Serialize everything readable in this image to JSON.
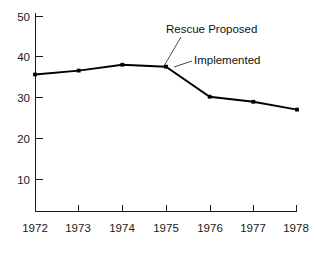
{
  "chart_data": {
    "type": "line",
    "title": "",
    "xlabel": "",
    "ylabel": "",
    "x": [
      1972,
      1973,
      1974,
      1975,
      1976,
      1977,
      1978
    ],
    "categories": [
      "1972",
      "1973",
      "1974",
      "1975",
      "1976",
      "1977",
      "1978"
    ],
    "values": [
      35,
      36,
      37.5,
      37,
      29.3,
      28,
      26
    ],
    "series": [
      {
        "name": "",
        "values": [
          35,
          36,
          37.5,
          37,
          29.3,
          28,
          26
        ]
      }
    ],
    "xlim": [
      1972,
      1978
    ],
    "ylim": [
      0,
      50
    ],
    "yticks": [
      10,
      20,
      30,
      40,
      50
    ],
    "ytick_labels": [
      "10",
      "20",
      "30",
      "40",
      "50"
    ],
    "xticks": [
      1972,
      1973,
      1974,
      1975,
      1976,
      1977,
      1978
    ],
    "xtick_labels": [
      "1972",
      "1973",
      "1974",
      "1975",
      "1976",
      "1977",
      "1978"
    ],
    "grid": false,
    "legend": "none",
    "markers": true,
    "line_color": "#000000",
    "annotations": [
      {
        "label": "Rescue Proposed",
        "text_x": 166,
        "text_y": 33,
        "point_x": 164,
        "point_y": 66
      },
      {
        "label": "Implemented",
        "text_x": 194,
        "text_y": 64,
        "point_x": 174,
        "point_y": 67
      }
    ]
  },
  "figure": {
    "width": 316,
    "height": 257,
    "background": "#ffffff",
    "axis_color": "#1a1a1a",
    "text_color": "#1a1a1a"
  },
  "axes": {
    "origin_x": 35,
    "origin_y": 211,
    "top_y": 16,
    "right_x": 297,
    "y_pixel_per_unit": 4.07,
    "x_pixel_per_year": 43.67
  }
}
